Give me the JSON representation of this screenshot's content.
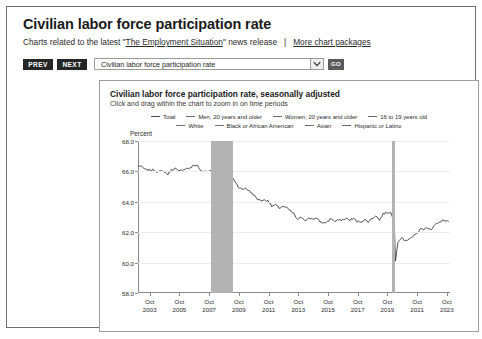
{
  "page": {
    "title": "Civilian labor force participation rate",
    "intro_prefix": "Charts related to the latest \"",
    "intro_link": "The Employment Situation",
    "intro_suffix": "\" news release",
    "separator": "|",
    "more_link": "More chart packages"
  },
  "toolbar": {
    "prev_label": "PREV",
    "next_label": "NEXT",
    "select_value": "Civilian labor force participation rate",
    "go_label": "GO",
    "dropdown_icon": "chevron-down-icon"
  },
  "chart_panel": {
    "title": "Civilian labor force participation rate, seasonally adjusted",
    "subtitle": "Click and drag within the chart to zoom in on time periods"
  },
  "chart_data": {
    "type": "line",
    "title": "Civilian labor force participation rate, seasonally adjusted",
    "xlabel": "",
    "ylabel": "Percent",
    "ylim": [
      58.0,
      68.0
    ],
    "yticks": [
      "58.0",
      "60.0",
      "62.0",
      "64.0",
      "66.0",
      "68.0"
    ],
    "ytick_values": [
      58.0,
      60.0,
      62.0,
      64.0,
      66.0,
      68.0
    ],
    "grid": true,
    "legend_position": "top-center",
    "xlim": [
      "2003-01",
      "2023-12"
    ],
    "xticks": [
      {
        "month": "Oct",
        "year": "2003",
        "x": 2003.79
      },
      {
        "month": "Oct",
        "year": "2005",
        "x": 2005.79
      },
      {
        "month": "Oct",
        "year": "2007",
        "x": 2007.79
      },
      {
        "month": "Oct",
        "year": "2009",
        "x": 2009.79
      },
      {
        "month": "Oct",
        "year": "2011",
        "x": 2011.79
      },
      {
        "month": "Oct",
        "year": "2013",
        "x": 2013.79
      },
      {
        "month": "Oct",
        "year": "2015",
        "x": 2015.79
      },
      {
        "month": "Oct",
        "year": "2017",
        "x": 2017.79
      },
      {
        "month": "Oct",
        "year": "2019",
        "x": 2019.79
      },
      {
        "month": "Oct",
        "year": "2021",
        "x": 2021.79
      },
      {
        "month": "Oct",
        "year": "2023",
        "x": 2023.79
      }
    ],
    "legend": [
      {
        "name": "Total",
        "color": "#4a4a4a",
        "visible": true
      },
      {
        "name": "Men, 20 years and older",
        "color": "#6b6b6b",
        "visible": false
      },
      {
        "name": "Women, 20 years and older",
        "color": "#6b6b6b",
        "visible": false
      },
      {
        "name": "16 to 19 years old",
        "color": "#6b6b6b",
        "visible": false
      },
      {
        "name": "White",
        "color": "#6b6b6b",
        "visible": false
      },
      {
        "name": "Black or African American",
        "color": "#6b6b6b",
        "visible": false
      },
      {
        "name": "Asian",
        "color": "#6b6b6b",
        "visible": false
      },
      {
        "name": "Hispanic or Latino",
        "color": "#6b6b6b",
        "visible": false
      }
    ],
    "recessions": [
      {
        "start": 2007.92,
        "end": 2009.42,
        "color": "#b3b3b3",
        "label": "recession-band-2007-2009"
      },
      {
        "start": 2020.08,
        "end": 2020.33,
        "color": "#b3b3b3",
        "label": "recession-band-2020"
      }
    ],
    "series": [
      {
        "name": "Total",
        "color": "#3d3d3d",
        "x": [
          2003.0,
          2003.25,
          2003.5,
          2003.75,
          2004.0,
          2004.25,
          2004.5,
          2004.75,
          2005.0,
          2005.25,
          2005.5,
          2005.75,
          2006.0,
          2006.25,
          2006.5,
          2006.75,
          2007.0,
          2007.25,
          2007.5,
          2007.75,
          2008.0,
          2008.25,
          2008.5,
          2008.75,
          2009.0,
          2009.25,
          2009.5,
          2009.75,
          2010.0,
          2010.25,
          2010.5,
          2010.75,
          2011.0,
          2011.25,
          2011.5,
          2011.75,
          2012.0,
          2012.25,
          2012.5,
          2012.75,
          2013.0,
          2013.25,
          2013.5,
          2013.75,
          2014.0,
          2014.25,
          2014.5,
          2014.75,
          2015.0,
          2015.25,
          2015.5,
          2015.75,
          2016.0,
          2016.25,
          2016.5,
          2016.75,
          2017.0,
          2017.25,
          2017.5,
          2017.75,
          2018.0,
          2018.25,
          2018.5,
          2018.75,
          2019.0,
          2019.25,
          2019.5,
          2019.75,
          2020.0,
          2020.25,
          2020.33,
          2020.42,
          2020.5,
          2020.75,
          2021.0,
          2021.25,
          2021.5,
          2021.75,
          2022.0,
          2022.25,
          2022.5,
          2022.75,
          2023.0,
          2023.25,
          2023.5,
          2023.75,
          2023.92
        ],
        "values": [
          66.4,
          66.3,
          66.1,
          66.1,
          66.1,
          66.0,
          66.0,
          66.0,
          65.8,
          66.1,
          66.2,
          66.0,
          66.1,
          66.2,
          66.2,
          66.4,
          66.4,
          66.0,
          66.0,
          66.0,
          66.2,
          66.1,
          66.1,
          66.0,
          65.7,
          65.7,
          65.4,
          65.0,
          64.8,
          64.9,
          64.7,
          64.5,
          64.2,
          64.1,
          64.1,
          64.1,
          63.7,
          63.8,
          63.6,
          63.7,
          63.6,
          63.4,
          63.2,
          62.8,
          63.0,
          62.8,
          62.9,
          62.9,
          62.9,
          62.7,
          62.6,
          62.7,
          62.9,
          62.7,
          62.8,
          62.8,
          62.9,
          62.8,
          62.9,
          62.7,
          62.7,
          62.8,
          62.7,
          62.9,
          63.1,
          62.8,
          63.2,
          63.3,
          63.3,
          62.7,
          60.1,
          60.8,
          61.4,
          61.7,
          61.4,
          61.6,
          61.7,
          61.9,
          62.2,
          62.2,
          62.3,
          62.2,
          62.5,
          62.6,
          62.8,
          62.7,
          62.7
        ]
      }
    ]
  }
}
